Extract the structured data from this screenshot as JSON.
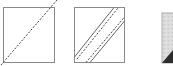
{
  "diagram": {
    "type": "quilting-steps",
    "colors": {
      "background": "#ffffff",
      "square_stroke": "#8a8a8a",
      "line_stroke": "#555555",
      "fabric_light": "#dcdcdc",
      "fabric_dark": "#2e2e2e"
    },
    "steps": [
      {
        "label": "",
        "shape": "square",
        "box": {
          "x": 3,
          "y": 7,
          "w": 52,
          "h": 56
        },
        "lines": [
          {
            "style": "dashed",
            "x1": 1,
            "y1": 65,
            "x2": 57,
            "y2": 0
          }
        ]
      },
      {
        "label": "",
        "shape": "square",
        "box": {
          "x": 74,
          "y": 7,
          "w": 51,
          "h": 56
        },
        "lines": [
          {
            "style": "solid",
            "x1": 74,
            "y1": 57,
            "x2": 114,
            "y2": 8
          },
          {
            "style": "dashed",
            "x1": 77,
            "y1": 58,
            "x2": 118,
            "y2": 9
          },
          {
            "style": "dashed",
            "x1": 86,
            "y1": 62,
            "x2": 122,
            "y2": 19
          },
          {
            "style": "solid",
            "x1": 90,
            "y1": 63,
            "x2": 125,
            "y2": 21
          }
        ]
      },
      {
        "label": "",
        "shape": "fabric-square-cropped",
        "box": {
          "x": 162,
          "y": 13,
          "w": 14,
          "h": 53
        },
        "dark_triangle": {
          "x1": 162,
          "y1": 63,
          "x2": 173,
          "y2": 50
        }
      }
    ]
  }
}
